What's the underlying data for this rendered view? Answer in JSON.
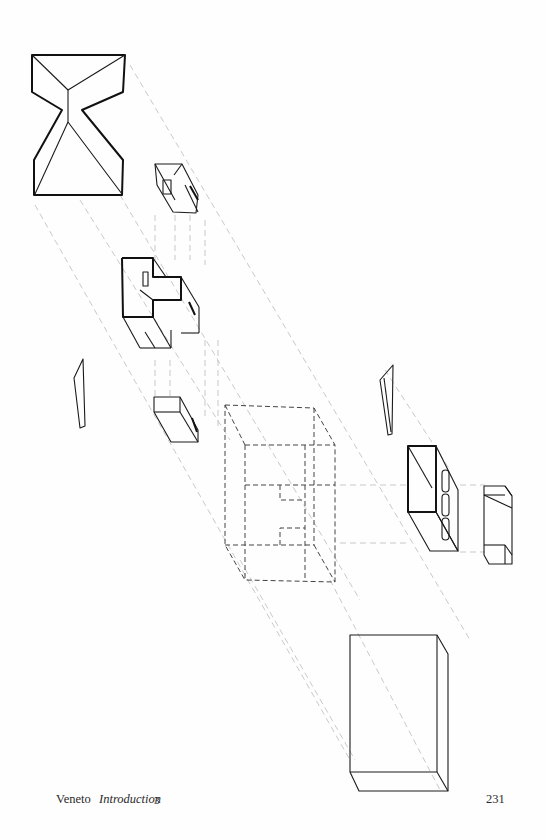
{
  "figure": {
    "components": [
      "roof-plan",
      "upper-volume-fragment",
      "central-cruciform-volume",
      "left-wall-panel",
      "small-box",
      "dashed-phantom-volume",
      "right-wall-panel",
      "slotted-block",
      "right-end-block",
      "base-block"
    ]
  },
  "footer": {
    "region": "Veneto",
    "section": "Introduction",
    "section_number": "3",
    "page_number": "231"
  }
}
